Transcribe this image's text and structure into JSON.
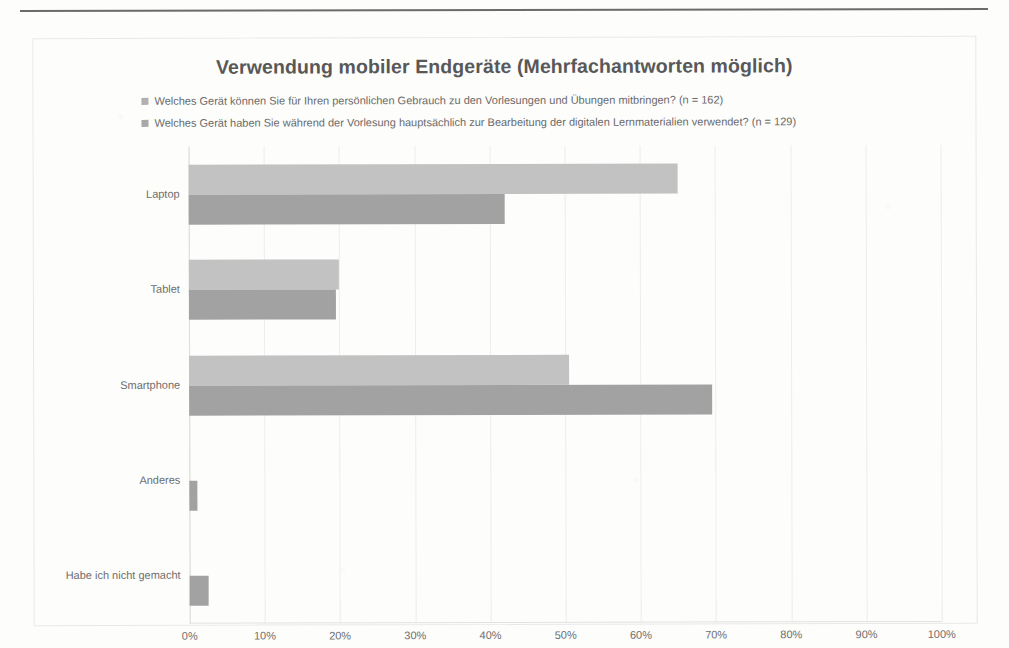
{
  "chart_data": {
    "type": "bar",
    "orientation": "horizontal",
    "title": "Verwendung mobiler Endgeräte (Mehrfachantworten möglich)",
    "xlabel": "",
    "ylabel": "",
    "xlim": [
      0,
      100
    ],
    "xunit": "%",
    "grid": true,
    "legend_position": "top",
    "categories": [
      "Laptop",
      "Tablet",
      "Smartphone",
      "Anderes",
      "Habe ich nicht gemacht"
    ],
    "xticks": [
      "0%",
      "10%",
      "20%",
      "30%",
      "40%",
      "50%",
      "60%",
      "70%",
      "80%",
      "90%",
      "100%"
    ],
    "xtick_values": [
      0,
      10,
      20,
      30,
      40,
      50,
      60,
      70,
      80,
      90,
      100
    ],
    "series": [
      {
        "name": "Welches Gerät können Sie für Ihren persönlichen Gebrauch zu den Vorlesungen und Übungen mitbringen? (n = 162)",
        "color": "#c2c2c2",
        "values": [
          65,
          20,
          50.5,
          0,
          0
        ]
      },
      {
        "name": "Welches Gerät haben Sie während der Vorlesung hauptsächlich zur Bearbeitung der digitalen Lernmaterialien verwendet? (n = 129)",
        "color": "#a2a2a2",
        "values": [
          42,
          19.5,
          69.5,
          1,
          2.5
        ]
      }
    ]
  },
  "legend": {
    "items": [
      {
        "label": "Welches Gerät können Sie für Ihren persönlichen Gebrauch zu den Vorlesungen und Übungen mitbringen? (n = 162)",
        "color": "#b0b0b0"
      },
      {
        "label": "Welches Gerät haben Sie während der Vorlesung hauptsächlich zur Bearbeitung der digitalen Lernmaterialien verwendet? (n = 129)",
        "color": "#a8a8a8"
      }
    ]
  },
  "colors": {
    "series1": "#c2c2c2",
    "series2": "#a2a2a2",
    "title": "#585858",
    "text": "#6e6e6e",
    "grid": "#ededed",
    "frame": "#e9e9e9"
  }
}
